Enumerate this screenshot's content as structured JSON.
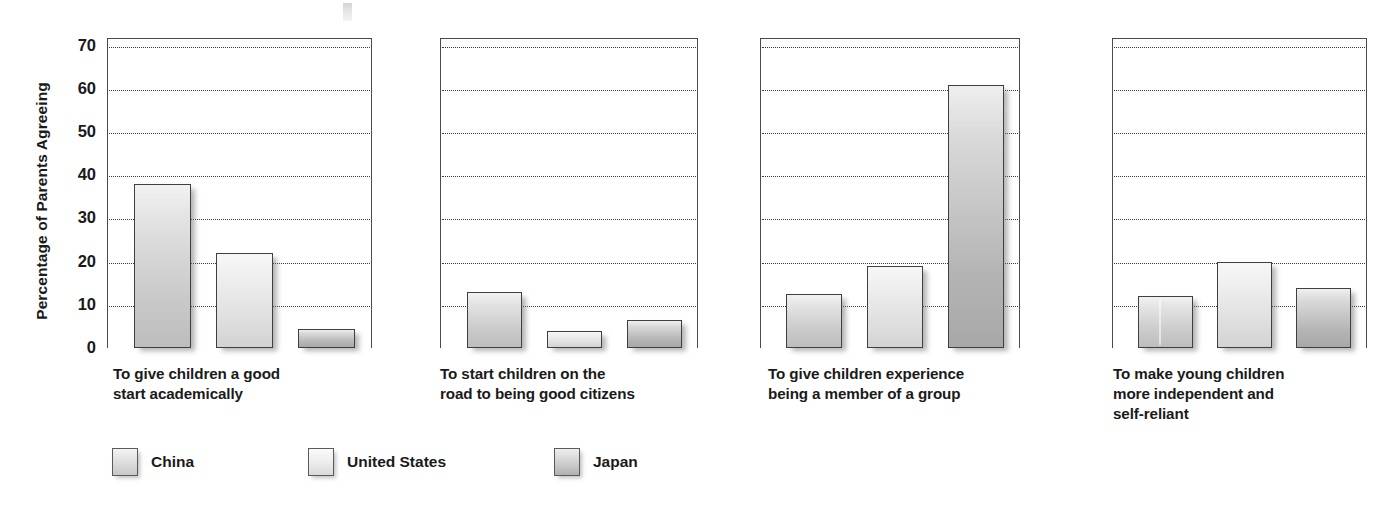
{
  "chart_data": {
    "type": "bar",
    "title": "",
    "xlabel": "",
    "ylabel": "Percentage of Parents Agreeing",
    "ylim": [
      0,
      70
    ],
    "yticks": [
      0,
      10,
      20,
      30,
      40,
      50,
      60,
      70
    ],
    "grid": true,
    "legend_position": "bottom-left",
    "categories": [
      "To give children a good start academically",
      "To start children on the road to being good citizens",
      "To give children experience being a member of a group",
      "To make young children more independent and self-reliant"
    ],
    "series": [
      {
        "name": "China",
        "values": [
          38,
          13,
          12.5,
          12
        ]
      },
      {
        "name": "United States",
        "values": [
          22,
          4,
          19,
          20
        ]
      },
      {
        "name": "Japan",
        "values": [
          4.5,
          6.5,
          61,
          14
        ]
      }
    ]
  },
  "axis": {
    "y_title": "Percentage of Parents Agreeing",
    "ticks": [
      "70",
      "60",
      "50",
      "40",
      "30",
      "20",
      "10",
      "0"
    ]
  },
  "panels": [
    {
      "caption_line1": "To give children a good",
      "caption_line2": "start academically",
      "caption_line3": ""
    },
    {
      "caption_line1": "To start children on the",
      "caption_line2": "road to being good citizens",
      "caption_line3": ""
    },
    {
      "caption_line1": "To give children experience",
      "caption_line2": "being a member of a group",
      "caption_line3": ""
    },
    {
      "caption_line1": "To make young children",
      "caption_line2": "more independent and",
      "caption_line3": "self-reliant"
    }
  ],
  "legend": {
    "items": [
      {
        "label": "China",
        "swatch": "china"
      },
      {
        "label": "United States",
        "swatch": "us"
      },
      {
        "label": "Japan",
        "swatch": "japan"
      }
    ]
  },
  "colors": {
    "bar_border": "#3f3f3f",
    "gridline": "#3a3a3a",
    "axis": "#4a4a4a",
    "text": "#1a1a1a",
    "background": "#ffffff"
  }
}
